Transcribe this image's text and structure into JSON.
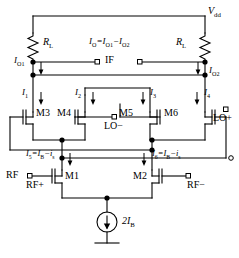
{
  "diagram": {
    "type": "schematic",
    "supply": {
      "label": "V",
      "sub": "dd"
    },
    "loads": {
      "left": {
        "label": "R",
        "sub": "L"
      },
      "right": {
        "label": "R",
        "sub": "L"
      }
    },
    "output": {
      "node_label": "IF",
      "current_equation": {
        "lhs": "I",
        "lhs_sub": "O",
        "rhs": "=I",
        "rhs_sub1": "O1",
        "minus": "−I",
        "rhs_sub2": "O2"
      },
      "left_branch": {
        "label": "I",
        "sub": "O1"
      },
      "right_branch": {
        "label": "I",
        "sub": "O2"
      }
    },
    "branch_currents": [
      {
        "name": "I1",
        "label": "I",
        "sub": "1"
      },
      {
        "name": "I2",
        "label": "I",
        "sub": "2"
      },
      {
        "name": "I3",
        "label": "I",
        "sub": "3"
      },
      {
        "name": "I4",
        "label": "I",
        "sub": "4"
      }
    ],
    "tail_currents": [
      {
        "name": "I5",
        "label": "I",
        "sub": "5",
        "eq": "=I",
        "eq_sub": "B",
        "tail": "−i",
        "tail_sub": "s"
      },
      {
        "name": "I6",
        "label": "I",
        "sub": "6",
        "eq": "=I",
        "eq_sub": "B",
        "tail": "−i",
        "tail_sub": "s"
      }
    ],
    "transistors": [
      {
        "id": "M1",
        "label": "M1"
      },
      {
        "id": "M2",
        "label": "M2"
      },
      {
        "id": "M3",
        "label": "M3"
      },
      {
        "id": "M4",
        "label": "M4"
      },
      {
        "id": "M5",
        "label": "M5"
      },
      {
        "id": "M6",
        "label": "M6"
      }
    ],
    "ports": {
      "rf_group": "RF",
      "rf_plus": "RF+",
      "rf_minus": "RF−",
      "lo_minus": "LO−",
      "lo_plus": "LO+"
    },
    "current_source": {
      "label": "2I",
      "sub": "B"
    },
    "colors": {
      "wire": "#000000",
      "text": "#000000",
      "background": "#ffffff"
    }
  }
}
